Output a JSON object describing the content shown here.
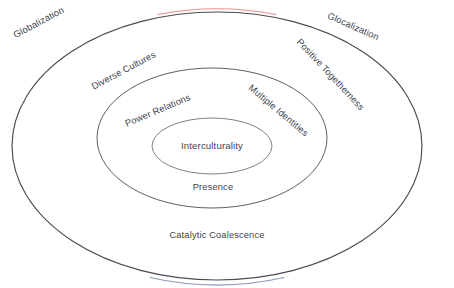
{
  "diagram": {
    "type": "concentric-ellipse",
    "background_color": "#ffffff",
    "text_color": "#3c3f4c",
    "rings": [
      {
        "id": "outer",
        "name": "outer-ellipse",
        "stroke_color": "#4a4a52",
        "stroke_accent_top": "#e8787d",
        "stroke_accent_bottom": "#5a6b9e",
        "stroke_width": 1.1,
        "cx": 217,
        "cy": 146,
        "rx": 205,
        "ry": 134
      },
      {
        "id": "middle",
        "name": "middle-ellipse",
        "stroke_color": "#5d5d66",
        "stroke_width": 1.0,
        "cx": 212,
        "cy": 138,
        "rx": 115,
        "ry": 70
      },
      {
        "id": "inner",
        "name": "inner-ellipse",
        "stroke_color": "#7a7a84",
        "stroke_width": 1.0,
        "cx": 212,
        "cy": 146,
        "rx": 60,
        "ry": 28
      }
    ],
    "labels": {
      "globalization": "Globalization",
      "glocalization": "Glocalization",
      "diverse_cultures": "Diverse Cultures",
      "positive_togetherness": "Positive Togetherness",
      "catalytic_coalescence": "Catalytic Coalescence",
      "power_relations": "Power Relations",
      "multiple_identities": "Multiple Identities",
      "presence": "Presence",
      "interculturality": "Interculturality"
    }
  }
}
